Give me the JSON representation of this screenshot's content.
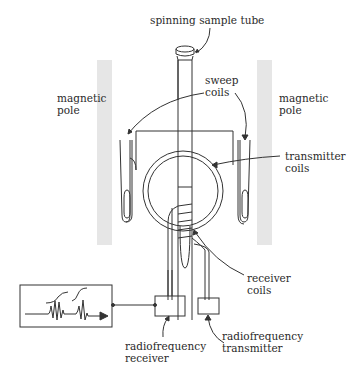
{
  "labels": {
    "sample_tube": "spinning sample tube",
    "sweep_coils_1": "sweep",
    "sweep_coils_2": "coils",
    "left_pole_1": "magnetic",
    "left_pole_2": "pole",
    "right_pole_1": "magnetic",
    "right_pole_2": "pole",
    "transmitter_coils_1": "transmitter",
    "transmitter_coils_2": "coils",
    "receiver_coils_1": "receiver",
    "receiver_coils_2": "coils",
    "rf_receiver_1": "radiofrequency",
    "rf_receiver_2": "receiver",
    "rf_transmitter_1": "radiofrequency",
    "rf_transmitter_2": "transmitter"
  },
  "colors": {
    "pole": "#e6e6e6",
    "line": "#333333"
  }
}
